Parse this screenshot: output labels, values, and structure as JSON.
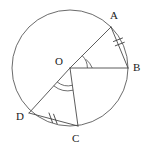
{
  "figure": {
    "type": "circle-geometry-diagram",
    "background_color": "#ffffff",
    "stroke_color": "#4a4a4a",
    "label_color": "#1a1a1a"
  },
  "circle": {
    "name": "main-circle",
    "center_label": "O",
    "center_x": 70,
    "center_y": 68,
    "radius": 58
  },
  "points": [
    {
      "id": "A",
      "label": "A",
      "x": 111,
      "y": 27,
      "label_x": 110,
      "label_y": 10
    },
    {
      "id": "B",
      "label": "B",
      "x": 128,
      "y": 68,
      "label_x": 133,
      "label_y": 62
    },
    {
      "id": "C",
      "label": "C",
      "x": 78,
      "y": 126,
      "label_x": 72,
      "label_y": 133
    },
    {
      "id": "D",
      "label": "D",
      "x": 29,
      "y": 113,
      "label_x": 16,
      "label_y": 111
    },
    {
      "id": "O",
      "label": "O",
      "x": 70,
      "y": 68,
      "label_x": 55,
      "label_y": 56
    }
  ],
  "segments": [
    {
      "name": "radius-OA",
      "from": "O",
      "to": "A"
    },
    {
      "name": "radius-OB",
      "from": "O",
      "to": "B"
    },
    {
      "name": "radius-OC",
      "from": "O",
      "to": "C"
    },
    {
      "name": "radius-OD",
      "from": "O",
      "to": "D"
    },
    {
      "name": "chord-AB",
      "from": "A",
      "to": "B",
      "ticks": 2
    },
    {
      "name": "chord-DC",
      "from": "D",
      "to": "C",
      "ticks": 2
    }
  ],
  "angles": [
    {
      "name": "angle-AOB",
      "vertex": "O",
      "arcs": 2
    },
    {
      "name": "angle-DOC",
      "vertex": "O",
      "arcs": 2
    }
  ],
  "labels": {
    "A": "A",
    "B": "B",
    "C": "C",
    "D": "D",
    "O": "O"
  }
}
